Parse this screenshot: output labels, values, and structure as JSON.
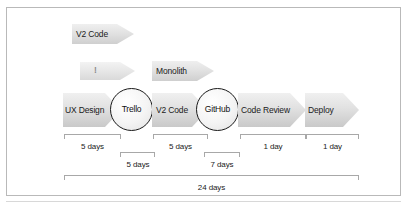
{
  "figure": {
    "type": "workflow-timeline-diagram",
    "background_color": "#ffffff",
    "frame_color": "#b9b9b9",
    "arrow_fill_color": "#e3e3e3",
    "node_stroke_color": "#1a1a1a",
    "measure_line_color": "#a8a8a8"
  },
  "upper_arrows": [
    {
      "label": "V2 Code",
      "faint": false
    },
    {
      "label": "!",
      "faint": true
    },
    {
      "label": "Monolith",
      "faint": false
    }
  ],
  "pipeline": {
    "steps": [
      {
        "kind": "arrow",
        "label": "UX Design"
      },
      {
        "kind": "circle",
        "label": "Trello"
      },
      {
        "kind": "arrow",
        "label": "V2 Code"
      },
      {
        "kind": "circle",
        "label": "GitHub"
      },
      {
        "kind": "arrow",
        "label": "Code Review"
      },
      {
        "kind": "arrow",
        "label": "Deploy"
      }
    ]
  },
  "measurements": {
    "row_upper": [
      {
        "label": "5 days"
      },
      {
        "label": "5 days"
      },
      {
        "label": "1 day"
      },
      {
        "label": "1 day"
      }
    ],
    "row_lower": [
      {
        "label": "5 days"
      },
      {
        "label": "7 days"
      }
    ],
    "total": {
      "label": "24 days"
    }
  }
}
